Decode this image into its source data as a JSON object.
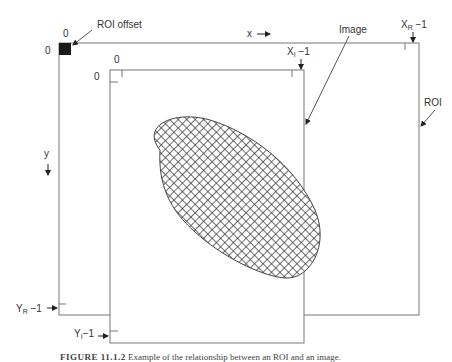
{
  "diagram": {
    "type": "roi-image-relationship",
    "roi": {
      "label": "ROI",
      "offset_label": "ROI offset",
      "x_end_label_main": "X",
      "x_end_label_sub": "R",
      "x_end_label_suffix": " −1",
      "y_end_label_main": "Y",
      "y_end_label_sub": "R",
      "y_end_label_suffix": " −1",
      "origin_x": "0",
      "origin_y": "0"
    },
    "image": {
      "label": "Image",
      "x_end_label_main": "X",
      "x_end_label_sub": "I",
      "x_end_label_suffix": " −1",
      "y_end_label_main": "Y",
      "y_end_label_sub": "I",
      "y_end_label_suffix": "−1",
      "origin_x": "0",
      "origin_y": "0"
    },
    "axes": {
      "x_label": "x",
      "y_label": "y"
    },
    "colors": {
      "line": "#777777",
      "offset_square": "#1a1a1a",
      "hatch": "#333333"
    }
  },
  "caption": {
    "figure": "FIGURE 11.1.2",
    "text": "Example of the relationship between an ROI and an image."
  }
}
